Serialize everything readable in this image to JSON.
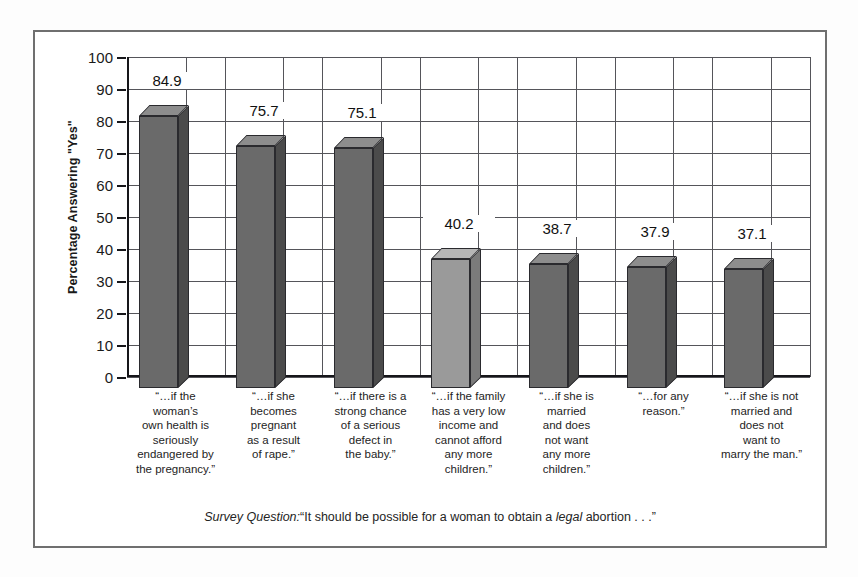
{
  "chart_data": {
    "type": "bar",
    "title": "",
    "subtitle": "",
    "xlabel": "",
    "ylabel": "Percentage Answering \"Yes\"",
    "ylim": [
      0,
      100
    ],
    "ytick_step": 10,
    "yticks": [
      "100",
      "90",
      "80",
      "70",
      "60",
      "50",
      "40",
      "30",
      "20",
      "10",
      "0"
    ],
    "grid": "both",
    "legend": "none",
    "categories": [
      "“…if the woman’s own health is seriously endangered by the pregnancy.”",
      "“…if she becomes pregnant as a result of rape.”",
      "“…if there is a strong chance of a serious defect in the baby.”",
      "“…if the family has a very low income and cannot afford any more children.”",
      "“…if she is married and does not want any more children.”",
      "“…for any reason.”",
      "“…if she is not married and does not want to marry the man.”"
    ],
    "category_lines": [
      [
        "“…if the",
        "woman’s",
        "own health is",
        "seriously",
        "endangered by",
        "the pregnancy.”"
      ],
      [
        "“…if she",
        "becomes",
        "pregnant",
        "as a result",
        "of rape.”"
      ],
      [
        "“…if there is a",
        "strong chance",
        "of a serious",
        "defect in",
        "the baby.”"
      ],
      [
        "“…if the family",
        "has a very low",
        "income and",
        "cannot afford",
        "any more",
        "children.”"
      ],
      [
        "“…if she is",
        "married",
        "and does",
        "not want",
        "any more",
        "children.”"
      ],
      [
        "“…for any",
        "reason.”"
      ],
      [
        "“…if she is not",
        "married and",
        "does not",
        "want to",
        "marry the man.”"
      ]
    ],
    "values": [
      84.9,
      75.7,
      75.1,
      40.2,
      38.7,
      37.9,
      37.1
    ],
    "value_labels": [
      "84.9",
      "75.7",
      "75.1",
      "40.2",
      "38.7",
      "37.9",
      "37.1"
    ],
    "bar_shading": [
      "dark",
      "dark",
      "dark",
      "light",
      "dark",
      "dark",
      "dark"
    ],
    "colors": {
      "bar_front_dark": "#6a6a6a",
      "bar_top_dark": "#8d8d8d",
      "bar_side_dark": "#4b4b4b",
      "bar_front_light": "#9a9a9a",
      "bar_top_light": "#b6b6b6",
      "bar_side_light": "#7b7b7b",
      "axis": "#16161a",
      "grid": "#55555a",
      "frame": "#6f6f6f",
      "text": "#1a1a1a"
    }
  },
  "caption": {
    "prefix": "Survey  Question:",
    "text": "“It should be possible for a woman to obtain a ",
    "emphasis": "legal",
    "suffix": " abortion . . .”"
  }
}
